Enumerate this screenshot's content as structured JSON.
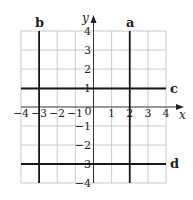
{
  "diagram": {
    "type": "coordinate-grid",
    "x_axis": {
      "label": "x",
      "min": -4,
      "max": 4,
      "ticks": [
        "−4",
        "−3",
        "−2",
        "−1",
        "0",
        "1",
        "2",
        "3",
        "4"
      ]
    },
    "y_axis": {
      "label": "y",
      "min": -4,
      "max": 4,
      "ticks": [
        "4",
        "3",
        "2",
        "1",
        "−1",
        "−2",
        "−3",
        "−4"
      ]
    },
    "lines": [
      {
        "label": "a",
        "orientation": "vertical",
        "equation": "x = 2"
      },
      {
        "label": "b",
        "orientation": "vertical",
        "equation": "x = -3"
      },
      {
        "label": "c",
        "orientation": "horizontal",
        "equation": "y = 1"
      },
      {
        "label": "d",
        "orientation": "horizontal",
        "equation": "y = -3"
      }
    ],
    "colors": {
      "grid": "#b8b8b8",
      "line": "#1a1a1a",
      "background": "#ffffff"
    }
  }
}
